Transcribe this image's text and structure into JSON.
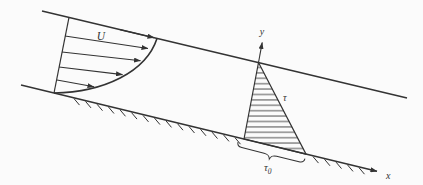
{
  "canvas": {
    "background": "#fbfbfb",
    "ink": "#333333"
  },
  "labels": {
    "free_stream_velocity": "U",
    "y_axis": "y",
    "x_axis": "x",
    "shear_stress": "τ",
    "wall_shear_symbol": "τ",
    "wall_shear_subscript": "0"
  }
}
